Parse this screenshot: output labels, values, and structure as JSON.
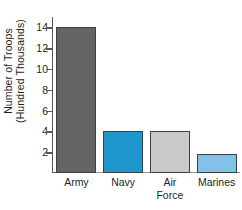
{
  "chart_data": {
    "type": "bar",
    "title": "",
    "xlabel": "",
    "ylabel": "Number of Troops (Hundred Thousands)",
    "ylabel_lines": [
      "Number of Troops",
      "(Hundred Thousands)"
    ],
    "categories": [
      "Army",
      "Navy",
      "Air Force",
      "Marines"
    ],
    "category_lines": [
      [
        "Army"
      ],
      [
        "Navy"
      ],
      [
        "Air",
        "Force"
      ],
      [
        "Marines"
      ]
    ],
    "values": [
      14,
      4,
      4,
      1.8
    ],
    "ylim": [
      0,
      15
    ],
    "yticks": [
      2,
      4,
      6,
      8,
      10,
      12,
      14
    ],
    "ytick_labels": [
      "2",
      "4",
      "6",
      "8",
      "10",
      "12",
      "14"
    ],
    "grid": false,
    "legend": false,
    "bar_colors": [
      "#636466",
      "#1f96ce",
      "#c9cacb",
      "#83c2e8"
    ],
    "bar_edge_color": "#3f4042",
    "axis_color": "#58595b",
    "baseline_color": "#939598",
    "background": "#ffffff"
  }
}
